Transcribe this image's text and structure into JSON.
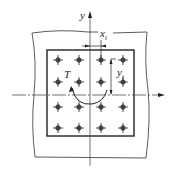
{
  "diagram": {
    "type": "bolt-group-torsion",
    "labels": {
      "y_axis": "y",
      "x_i": "x",
      "x_i_sub": "i",
      "y_i": "y",
      "y_i_sub": "i",
      "torque": "T"
    },
    "bolt_grid": {
      "rows": 4,
      "cols": 4
    },
    "colors": {
      "stroke": "#222222",
      "bolt": "#555555",
      "background": "#ffffff"
    }
  }
}
